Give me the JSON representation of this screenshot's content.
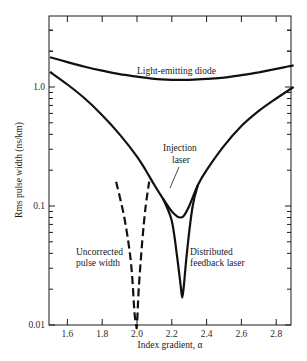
{
  "chart_data": {
    "type": "line",
    "title": "",
    "xlabel": "Index gradient, α",
    "ylabel": "Rms pulse width (ns/km)",
    "xlim": [
      1.5,
      2.9
    ],
    "ylim": [
      0.01,
      4.0
    ],
    "yscale": "log",
    "grid": false,
    "x_ticks": [
      1.6,
      1.8,
      2.0,
      2.2,
      2.4,
      2.6,
      2.8
    ],
    "x_tick_labels": [
      "1.6",
      "1.8",
      "2.0",
      "2.2",
      "2.4",
      "2.6",
      "2.8"
    ],
    "y_ticks": [
      0.01,
      0.1,
      1.0
    ],
    "y_tick_labels": [
      "0.01",
      "0.1",
      "1.0"
    ],
    "series": [
      {
        "name": "Light-emitting diode",
        "style": "solid",
        "x": [
          1.5,
          1.6,
          1.7,
          1.8,
          1.9,
          2.0,
          2.1,
          2.2,
          2.3,
          2.4,
          2.5,
          2.6,
          2.7,
          2.8,
          2.9
        ],
        "values": [
          1.78,
          1.62,
          1.48,
          1.37,
          1.28,
          1.22,
          1.17,
          1.15,
          1.15,
          1.17,
          1.2,
          1.26,
          1.33,
          1.42,
          1.52
        ]
      },
      {
        "name": "Injection laser",
        "style": "solid",
        "x": [
          1.5,
          1.6,
          1.7,
          1.8,
          1.9,
          2.0,
          2.05,
          2.1,
          2.15,
          2.2,
          2.23,
          2.25,
          2.27,
          2.3,
          2.35,
          2.4,
          2.5,
          2.6,
          2.7,
          2.8,
          2.9
        ],
        "values": [
          1.34,
          1.05,
          0.8,
          0.58,
          0.4,
          0.26,
          0.2,
          0.15,
          0.115,
          0.09,
          0.082,
          0.08,
          0.083,
          0.1,
          0.15,
          0.2,
          0.32,
          0.47,
          0.63,
          0.8,
          1.0
        ]
      },
      {
        "name": "Distributed feedback laser",
        "style": "solid",
        "x": [
          2.15,
          2.2,
          2.23,
          2.25,
          2.26,
          2.27,
          2.29,
          2.32,
          2.35
        ],
        "values": [
          0.115,
          0.075,
          0.038,
          0.022,
          0.017,
          0.022,
          0.045,
          0.1,
          0.15
        ]
      },
      {
        "name": "Uncorrected pulse width",
        "style": "dashed",
        "x": [
          1.88,
          1.92,
          1.95,
          1.97,
          1.985,
          1.995,
          2.0,
          2.01,
          2.03,
          2.05,
          2.07
        ],
        "values": [
          0.16,
          0.09,
          0.05,
          0.028,
          0.013,
          0.0095,
          0.0095,
          0.02,
          0.05,
          0.1,
          0.16
        ]
      }
    ],
    "annotations": [
      {
        "text": "Light-emitting diode",
        "x": 2.13,
        "y": 1.3
      },
      {
        "text": "Injection",
        "x": 2.22,
        "y": 0.21
      },
      {
        "text": "laser",
        "x": 2.22,
        "y": 0.17
      },
      {
        "text": "Uncorrected",
        "x": 1.62,
        "y": 0.033
      },
      {
        "text": "pulse width",
        "x": 1.62,
        "y": 0.026
      },
      {
        "text": "Distributed",
        "x": 2.28,
        "y": 0.033
      },
      {
        "text": "feedback laser",
        "x": 2.28,
        "y": 0.026
      }
    ]
  },
  "labels": {
    "led": "Light-emitting diode",
    "inj1": "Injection",
    "inj2": "laser",
    "unc1": "Uncorrected",
    "unc2": "pulse width",
    "dfb1": "Distributed",
    "dfb2": "feedback laser",
    "xlabel": "Index gradient, α",
    "ylabel": "Rms pulse width (ns/km)"
  }
}
